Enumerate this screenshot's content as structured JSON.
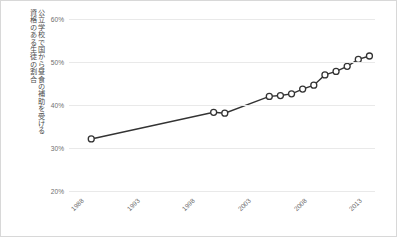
{
  "chart_data": {
    "type": "line",
    "title": "",
    "xlabel": "年",
    "ylabel_columns": [
      "公立学校で国から昼食の補助を受ける",
      "資格のある生徒の割合"
    ],
    "ylabel": "公立学校で国から昼食の補助を受ける資格のある生徒の割合",
    "xlim": [
      1987,
      2014.5
    ],
    "ylim": [
      20,
      60
    ],
    "grid": true,
    "legend": "none",
    "yticks": [
      "20%",
      "30%",
      "40%",
      "50%",
      "60%"
    ],
    "ytick_values": [
      20,
      30,
      40,
      50,
      60
    ],
    "xticks": [
      "1988",
      "1993",
      "1998",
      "2003",
      "2008",
      "2013"
    ],
    "xtick_values": [
      1988,
      1993,
      1998,
      2003,
      2008,
      2013
    ],
    "marker": "open-circle",
    "line_color": "#333333",
    "marker_color": "#333333",
    "grid_color": "#e9e9e9",
    "x": [
      1989,
      2000,
      2001,
      2005,
      2006,
      2007,
      2008,
      2009,
      2010,
      2011,
      2012,
      2013,
      2014
    ],
    "values": [
      32.1,
      38.3,
      38.1,
      42.0,
      42.2,
      42.6,
      43.7,
      44.6,
      47.0,
      47.8,
      49.0,
      50.6,
      51.4
    ],
    "points": [
      {
        "year": 1989,
        "percent": 32.1
      },
      {
        "year": 2000,
        "percent": 38.3
      },
      {
        "year": 2001,
        "percent": 38.1
      },
      {
        "year": 2005,
        "percent": 42.0
      },
      {
        "year": 2006,
        "percent": 42.2
      },
      {
        "year": 2007,
        "percent": 42.6
      },
      {
        "year": 2008,
        "percent": 43.7
      },
      {
        "year": 2009,
        "percent": 44.6
      },
      {
        "year": 2010,
        "percent": 47.0
      },
      {
        "year": 2011,
        "percent": 47.8
      },
      {
        "year": 2012,
        "percent": 49.0
      },
      {
        "year": 2013,
        "percent": 50.6
      },
      {
        "year": 2014,
        "percent": 51.4
      }
    ]
  }
}
